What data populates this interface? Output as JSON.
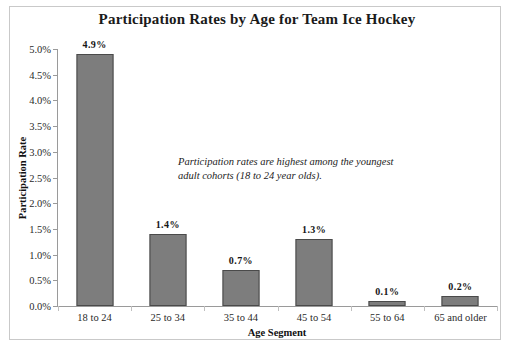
{
  "chart_data": {
    "type": "bar",
    "title": "Participation Rates by Age for Team Ice Hockey",
    "xlabel": "Age Segment",
    "ylabel": "Participation Rate",
    "categories": [
      "18 to 24",
      "25 to 34",
      "35 to 44",
      "45 to 54",
      "55 to 64",
      "65 and older"
    ],
    "values": [
      4.9,
      1.4,
      0.7,
      1.3,
      0.1,
      0.2
    ],
    "value_labels": [
      "4.9%",
      "1.4%",
      "0.7%",
      "1.3%",
      "0.1%",
      "0.2%"
    ],
    "ylim": [
      0,
      5
    ],
    "ytick_values": [
      0,
      0.5,
      1,
      1.5,
      2,
      2.5,
      3,
      3.5,
      4,
      4.5,
      5
    ],
    "ytick_labels": [
      "0.0%",
      "0.5%",
      "1.0%",
      "1.5%",
      "2.0%",
      "2.5%",
      "3.0%",
      "3.5%",
      "4.0%",
      "4.5%",
      "5.0%"
    ],
    "grid": false,
    "legend": false,
    "annotations": [
      "Participation rates are highest among the youngest adult cohorts (18 to 24 year olds)."
    ],
    "series": [
      {
        "name": "Participation Rate",
        "values": [
          4.9,
          1.4,
          0.7,
          1.3,
          0.1,
          0.2
        ]
      }
    ],
    "colors": {
      "bar_fill": "#7d7d7d",
      "bar_border": "#4a4a4a",
      "axis": "#9a9a9a",
      "text": "#1a1a1a",
      "frame": "#c9c9c9",
      "background": "#ffffff"
    }
  }
}
